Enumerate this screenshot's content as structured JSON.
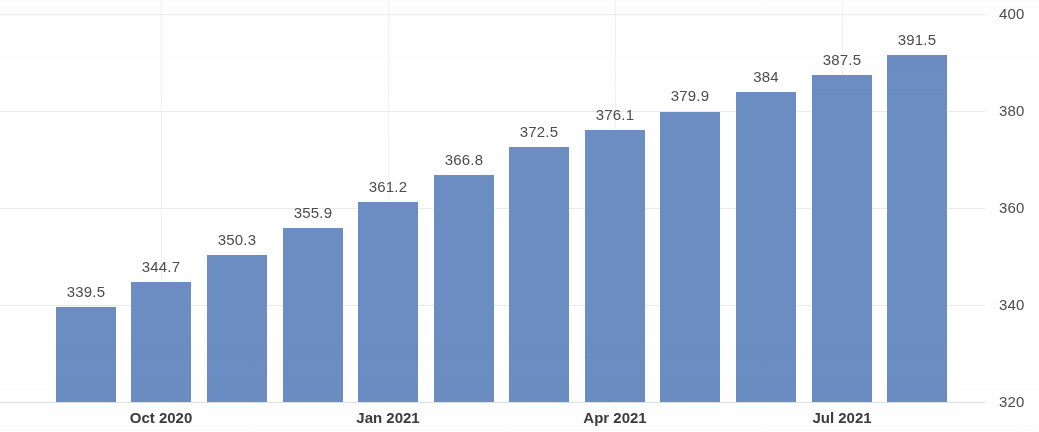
{
  "chart_data": {
    "type": "bar",
    "title": "",
    "subtitle": "",
    "xlabel": "",
    "ylabel": "",
    "ylim": [
      320,
      400
    ],
    "yticks": [
      320,
      340,
      360,
      380,
      400
    ],
    "grid": true,
    "legend": null,
    "series_color": "#6b8dc2",
    "categories": [
      "Sep 2020",
      "Oct 2020",
      "Nov 2020",
      "Dec 2020",
      "Jan 2021",
      "Feb 2021",
      "Mar 2021",
      "Apr 2021",
      "May 2021",
      "Jun 2021",
      "Jul 2021",
      "Aug 2021"
    ],
    "values": [
      339.5,
      344.7,
      350.3,
      355.9,
      361.2,
      366.8,
      372.5,
      376.1,
      379.9,
      384,
      387.5,
      391.5
    ],
    "value_labels": [
      "339.5",
      "344.7",
      "350.3",
      "355.9",
      "361.2",
      "366.8",
      "372.5",
      "376.1",
      "379.9",
      "384",
      "387.5",
      "391.5"
    ],
    "x_tick_labels": [
      {
        "label": "Oct 2020",
        "index": 1
      },
      {
        "label": "Jan 2021",
        "index": 4
      },
      {
        "label": "Apr 2021",
        "index": 7
      },
      {
        "label": "Jul 2021",
        "index": 10
      }
    ],
    "y_tick_labels": [
      "320",
      "340",
      "360",
      "380",
      "400"
    ]
  },
  "colors": {
    "bar": "#6b8dc2",
    "grid": "#e4e6ea",
    "label_text": "#4d4d4d",
    "axis_text": "#3c3c3c",
    "background": "#ffffff"
  }
}
